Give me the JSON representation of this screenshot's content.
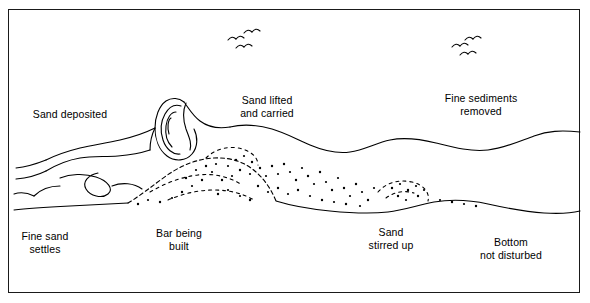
{
  "figure": {
    "frame_color": "#1a1a1a",
    "ink_color": "#000000",
    "background": "#ffffff"
  },
  "labels": [
    {
      "id": "sand-deposited",
      "text": "Sand deposited",
      "x": 45,
      "y": 114
    },
    {
      "id": "sand-lifted-carried",
      "text": "Sand lifted\nand carried",
      "x": 267,
      "y": 100
    },
    {
      "id": "fine-sediments-removed",
      "text": "Fine sediments\nremoved",
      "x": 481,
      "y": 98
    },
    {
      "id": "fine-sand-settles",
      "text": "Fine sand\nsettles",
      "x": 41,
      "y": 236
    },
    {
      "id": "bar-being-built",
      "text": "Bar being\nbuilt",
      "x": 179,
      "y": 233
    },
    {
      "id": "sand-stirred-up",
      "text": "Sand\nstirred up",
      "x": 391,
      "y": 232
    },
    {
      "id": "bottom-not-disturbed",
      "text": "Bottom\nnot disturbed",
      "x": 511,
      "y": 242
    }
  ],
  "birds": [
    {
      "id": "bird-flock-left",
      "x": 232,
      "y": 36
    },
    {
      "id": "bird-flock-right",
      "x": 455,
      "y": 44
    }
  ],
  "features": {
    "water_surface": "wave profile rising from left shore to right offshore",
    "breaking_wave": "plunging breaker with curl at x=150-195",
    "seabed": "sloping bottom with offshore bar",
    "suspended_sediment": "stipple cloud above bar and mid-profile",
    "bar_crest_x": 215
  }
}
